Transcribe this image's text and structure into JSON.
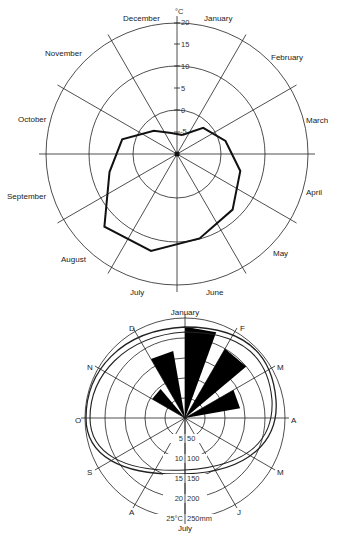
{
  "chart_data": [
    {
      "type": "radar",
      "title": "",
      "unit_label": "°C",
      "center": [
        177,
        154
      ],
      "radial_axis": {
        "min": -10,
        "max": 20,
        "ticks": [
          20,
          15,
          10,
          5,
          0,
          -5
        ],
        "tick_labels": [
          "20",
          "15",
          "10",
          "5",
          "0",
          "-5"
        ],
        "circles_at": [
          0,
          10,
          20
        ]
      },
      "categories": [
        "January",
        "February",
        "March",
        "April",
        "May",
        "June",
        "July",
        "August",
        "September",
        "October",
        "November",
        "December"
      ],
      "series": [
        {
          "name": "Temperature",
          "values": [
            -5.5,
            -1.5,
            1.5,
            5,
            8,
            10,
            13,
            13.5,
            6,
            3,
            -2.5,
            -5
          ]
        }
      ],
      "grid": true
    },
    {
      "type": "polar-bar",
      "title": "",
      "center": [
        185,
        418
      ],
      "categories_short": [
        "January",
        "F",
        "M",
        "A",
        "M",
        "J",
        "July",
        "A",
        "S",
        "O",
        "N",
        "D"
      ],
      "radial_axis": {
        "ticks_temp": [
          5,
          10,
          15,
          20,
          25
        ],
        "ticks_precip": [
          50,
          100,
          150,
          200,
          250
        ],
        "tick_labels": [
          "5",
          "50",
          "10",
          "100",
          "15",
          "150",
          "20",
          "200",
          "25°C",
          "250mm"
        ]
      },
      "series": [
        {
          "name": "Precipitation (mm)",
          "values": [
            228,
            200,
            140,
            5,
            0,
            0,
            0,
            0,
            0,
            5,
            95,
            170
          ]
        },
        {
          "name": "Temperature curve 1",
          "shape": "closed-loop"
        },
        {
          "name": "Temperature curve 2",
          "shape": "closed-loop"
        }
      ],
      "grid": true
    }
  ],
  "top_chart": {
    "unit": "°C",
    "ticks": [
      "20",
      "15",
      "10",
      "5",
      "0",
      "-5"
    ],
    "months": [
      "January",
      "February",
      "March",
      "April",
      "May",
      "June",
      "July",
      "August",
      "September",
      "October",
      "November",
      "December"
    ]
  },
  "bottom_chart": {
    "months": [
      "January",
      "F",
      "M",
      "A",
      "M",
      "J",
      "July",
      "A",
      "S",
      "O",
      "N",
      "D"
    ],
    "ticks": [
      {
        "t": "5",
        "p": "50"
      },
      {
        "t": "10",
        "p": "100"
      },
      {
        "t": "15",
        "p": "150"
      },
      {
        "t": "20",
        "p": "200"
      },
      {
        "t": "25°C",
        "p": "250mm"
      }
    ]
  }
}
